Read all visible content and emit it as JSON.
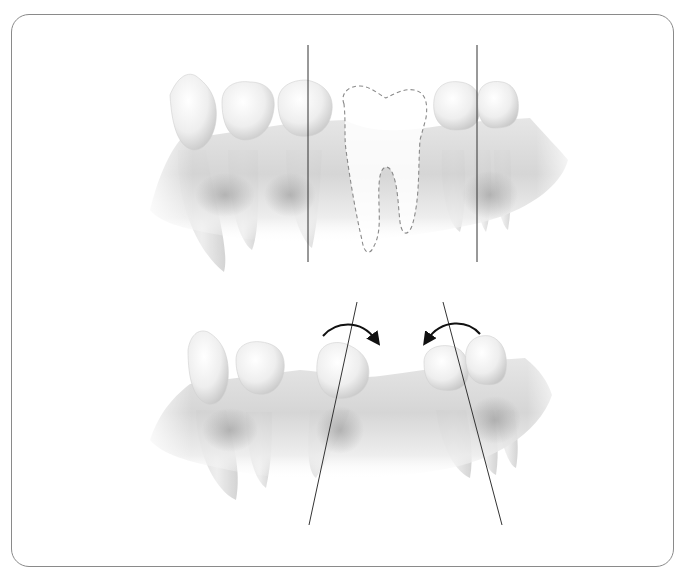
{
  "figure": {
    "frame": {
      "x": 11,
      "y": 14,
      "width": 663,
      "height": 553,
      "radius": 18,
      "stroke": "#8a8a8a"
    },
    "colors": {
      "tooth_fill": "#f2f2f2",
      "tooth_shade": "#c9c9c9",
      "gum_fill": "#dcdcdc",
      "gum_dark": "#9a9a9a",
      "axis_line": "#333333",
      "dashed_outline": "#8a8a8a",
      "arrow": "#111111"
    },
    "panels": [
      {
        "id": "top",
        "label": "before-drift",
        "axis_lines": [
          {
            "x1": 308,
            "y1": 45,
            "x2": 308,
            "y2": 262
          },
          {
            "x1": 477,
            "y1": 45,
            "x2": 477,
            "y2": 262
          }
        ],
        "missing_tooth": "dashed-outline"
      },
      {
        "id": "bottom",
        "label": "after-drift",
        "axis_lines": [
          {
            "x1": 357,
            "y1": 302,
            "x2": 309,
            "y2": 525
          },
          {
            "x1": 443,
            "y1": 302,
            "x2": 502,
            "y2": 525
          }
        ],
        "arrows": [
          {
            "direction": "clockwise",
            "icon": "curved-arrow-right-icon"
          },
          {
            "direction": "counter-clockwise",
            "icon": "curved-arrow-left-icon"
          }
        ]
      }
    ]
  }
}
